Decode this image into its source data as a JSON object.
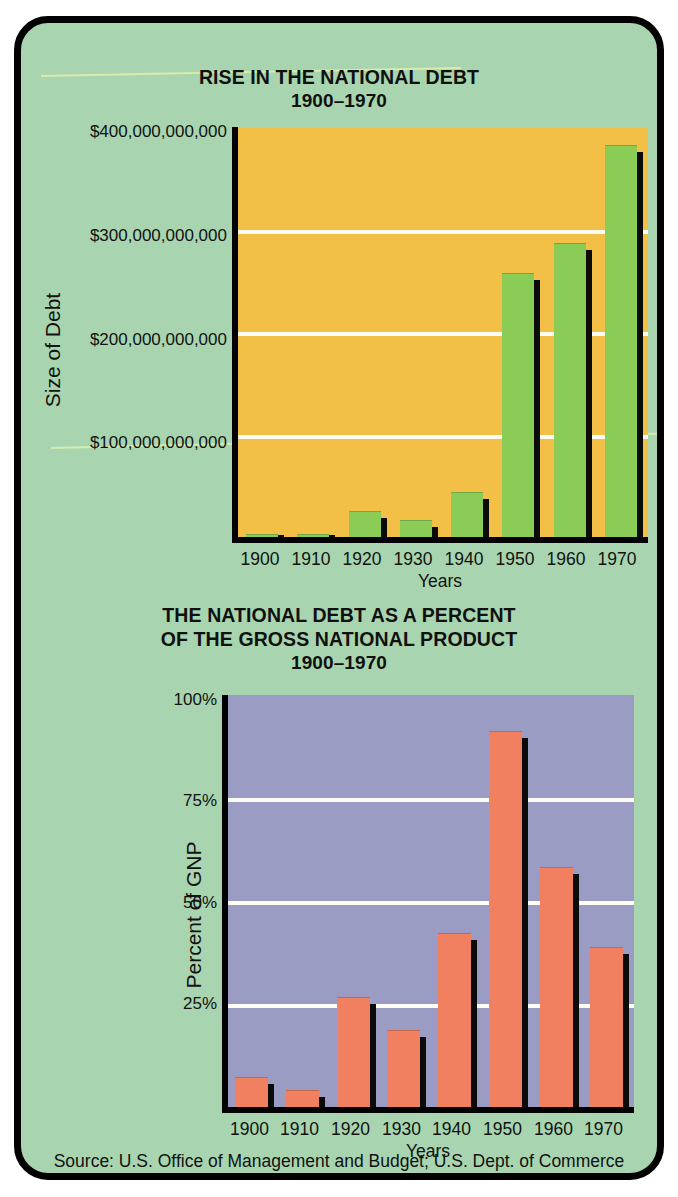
{
  "poster": {
    "background_color": "#a8d5b0",
    "border_color": "#000000",
    "source": "Source: U.S. Office of Management and Budget; U.S. Dept. of Commerce"
  },
  "chart_data": [
    {
      "type": "bar",
      "title": "RISE IN THE NATIONAL DEBT",
      "subtitle": "1900–1970",
      "xlabel": "Years",
      "ylabel": "Size of Debt",
      "categories": [
        "1900",
        "1910",
        "1920",
        "1930",
        "1940",
        "1950",
        "1960",
        "1970"
      ],
      "values": [
        1200000000,
        1100000000,
        24000000000,
        16000000000,
        43000000000,
        257000000000,
        286000000000,
        381000000000
      ],
      "value_labels": [
        "$1,200,000,000",
        "$1,100,000,000",
        "$24,000,000,000",
        "$16,000,000,000",
        "$43,000,000,000",
        "$257,000,000,000",
        "$286,000,000,000",
        "$381,000,000,000"
      ],
      "ylim": [
        0,
        400000000000
      ],
      "yticks": [
        100000000000,
        200000000000,
        300000000000,
        400000000000
      ],
      "ytick_labels": [
        "$100,000,000,000",
        "$200,000,000,000",
        "$300,000,000,000",
        "$400,000,000,000"
      ],
      "grid": true,
      "gridline_color": "#fdfdf5",
      "plot_background": "#f2bf47",
      "bar_color": "#8bcc56",
      "bar_shadow_color": "#0b0b0a",
      "legend": "none"
    },
    {
      "type": "bar",
      "title_line1": "THE NATIONAL DEBT AS A PERCENT",
      "title_line2": "OF THE GROSS NATIONAL PRODUCT",
      "subtitle": "1900–1970",
      "xlabel": "Years",
      "ylabel": "Percent of GNP",
      "categories": [
        "1900",
        "1910",
        "1920",
        "1930",
        "1940",
        "1950",
        "1960",
        "1970"
      ],
      "values": [
        7,
        4,
        26.5,
        18.5,
        42,
        91,
        58,
        38.5
      ],
      "value_labels": [
        "7%",
        "4%",
        "26.5%",
        "18.5%",
        "42%",
        "91%",
        "58%",
        "38.5%"
      ],
      "ylim": [
        0,
        100
      ],
      "yticks": [
        25,
        50,
        75,
        100
      ],
      "ytick_labels": [
        "25%",
        "50%",
        "75%",
        "100%"
      ],
      "grid": true,
      "gridline_color": "#fdfdf5",
      "plot_background": "#9a9cc4",
      "bar_color": "#f08060",
      "bar_shadow_color": "#0b0b0a",
      "legend": "none"
    }
  ]
}
